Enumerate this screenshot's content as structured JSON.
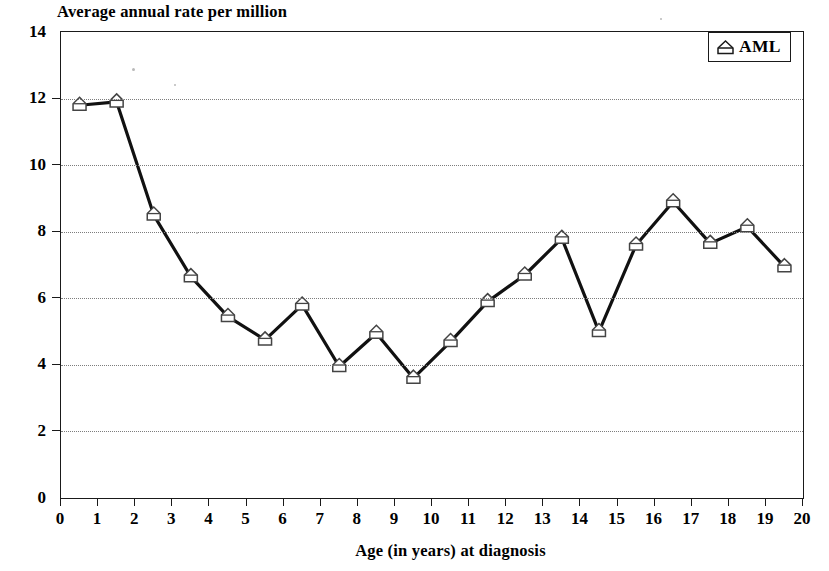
{
  "chart_data": {
    "type": "line",
    "title": "Average annual rate per million",
    "subtitle": "",
    "xlabel": "Age (in years) at diagnosis",
    "ylabel": "",
    "ylim": [
      0,
      14
    ],
    "xlim": [
      0,
      20
    ],
    "grid": true,
    "grid_axis": "y",
    "legend_position": "top-right",
    "marker": "pentagon-house-outline",
    "xticks": [
      "0",
      "1",
      "2",
      "3",
      "4",
      "5",
      "6",
      "7",
      "8",
      "9",
      "10",
      "11",
      "12",
      "13",
      "14",
      "15",
      "16",
      "17",
      "18",
      "19",
      "20"
    ],
    "yticks": [
      "0",
      "2",
      "4",
      "6",
      "8",
      "10",
      "12",
      "14"
    ],
    "series": [
      {
        "name": "AML",
        "x": [
          0.5,
          1.5,
          2.5,
          3.5,
          4.5,
          5.5,
          6.5,
          7.5,
          8.5,
          9.5,
          10.5,
          11.5,
          12.5,
          13.5,
          14.5,
          15.5,
          16.5,
          17.5,
          18.5,
          19.5
        ],
        "values": [
          11.8,
          11.9,
          8.5,
          6.65,
          5.45,
          4.75,
          5.8,
          3.95,
          4.95,
          3.6,
          4.7,
          5.9,
          6.7,
          7.8,
          5.0,
          7.6,
          8.9,
          7.65,
          8.15,
          6.95
        ]
      }
    ]
  },
  "legend": {
    "entries": [
      {
        "label": "AML",
        "marker": "pentagon-house-outline",
        "color": "#000000"
      }
    ]
  },
  "colors": {
    "line": "#111111",
    "marker_fill": "#ffffff",
    "marker_stroke": "#444444",
    "grid": "#7d7d7d",
    "axis": "#1a1a1a",
    "background": "#ffffff"
  }
}
